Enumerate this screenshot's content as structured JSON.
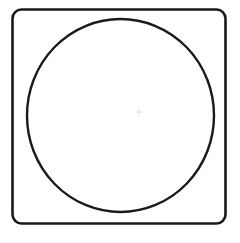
{
  "canvas": {
    "name": "line-drawing-canvas",
    "width": 240,
    "height": 243,
    "background_color": "#FFFFFF",
    "description": "Black line drawing of a rounded square with an inscribed circle"
  },
  "palette": {
    "ink": "#1A1A1A",
    "background": "#FFFFFF",
    "faint_mark": "#E2DCD4"
  },
  "shapes": {
    "rounded_square": {
      "label": "rounded-square",
      "x": 12.5,
      "y": 9.5,
      "width": 213,
      "height": 214,
      "corner_radius": 9,
      "stroke_color": "#1A1A1A",
      "stroke_width": 2.6,
      "fill": "none"
    },
    "circle": {
      "label": "inscribed-circle",
      "center_x": 120.5,
      "center_y": 115.5,
      "radius_x": 93.5,
      "radius_y": 96.5,
      "stroke_color": "#1A1A1A",
      "stroke_width": 2.4,
      "fill": "none"
    },
    "center_mark": {
      "label": "faint-center-mark",
      "center_x": 139,
      "center_y": 112,
      "length": 7,
      "stroke_color": "#E2DCD4",
      "stroke_width": 1
    }
  }
}
